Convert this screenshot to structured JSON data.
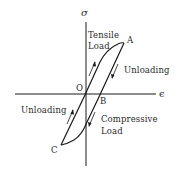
{
  "diagram": {
    "type": "stress-strain hysteresis loop",
    "axes": {
      "y_label": "σ",
      "x_label": "ϵ"
    },
    "points": {
      "origin": "O",
      "a": "A",
      "b": "B",
      "c": "C"
    },
    "labels": {
      "tensile_line1": "Tensile",
      "tensile_line2": "Load",
      "unloading_right": "Unloading",
      "unloading_left": "Unloading",
      "compressive_line1": "Compressive",
      "compressive_line2": "Load"
    },
    "colors": {
      "line": "#1a1a1a",
      "text": "#2a2a2a",
      "background": "#ffffff"
    }
  }
}
